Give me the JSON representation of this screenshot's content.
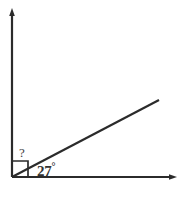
{
  "figure": {
    "type": "angle-diagram",
    "background_color": "#ffffff",
    "stroke_color": "#2b2b2b",
    "labels": {
      "unknown_angle": "?",
      "known_angle_value": "27",
      "degree_symbol": "°"
    },
    "rays": {
      "vertical_ray": "vertical ray from vertex upward with arrowhead",
      "horizontal_ray": "horizontal ray from vertex rightward with arrowhead",
      "diagonal_ray": "ray from vertex up-and-right at 27 degrees"
    },
    "markers": {
      "right_angle_square": "square marker at vertex indicating 90 degrees"
    },
    "vertex": {
      "x": 12,
      "y": 177
    }
  }
}
